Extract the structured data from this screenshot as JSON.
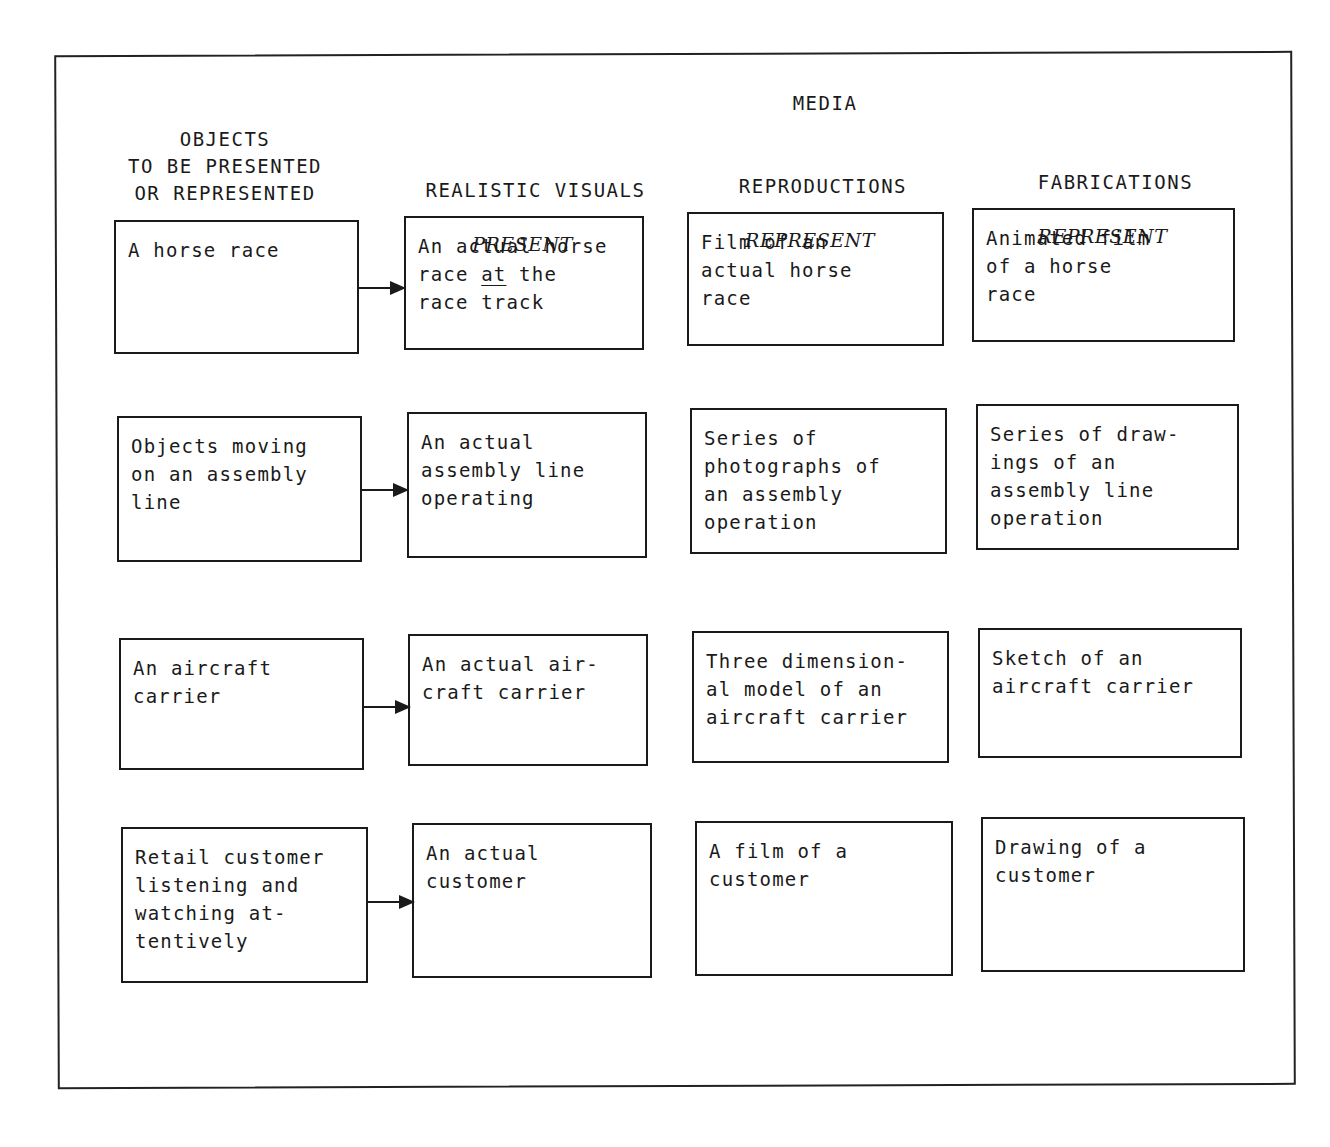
{
  "diagram": {
    "media_label": "MEDIA",
    "columns": [
      {
        "title": "OBJECTS\nTO BE PRESENTED\nOR REPRESENTED",
        "subtitle": ""
      },
      {
        "title": "REALISTIC VISUALS",
        "subtitle": "PRESENT"
      },
      {
        "title": "REPRODUCTIONS",
        "subtitle": "REPRESENT"
      },
      {
        "title": "FABRICATIONS",
        "subtitle": "REPRESENT"
      }
    ],
    "rows": [
      {
        "object": "A horse race",
        "realistic_pre": "An actual horse\nrace ",
        "realistic_underlined": "at",
        "realistic_post": " the\nrace track",
        "reproduction": "Film of an\nactual horse\nrace",
        "fabrication": "Animated film\nof a horse\nrace"
      },
      {
        "object": "Objects moving\non an assembly\nline",
        "realistic": "An actual\nassembly line\noperating",
        "reproduction": "Series of\nphotographs of\nan assembly\noperation",
        "fabrication": "Series of draw-\nings of an\nassembly line\noperation"
      },
      {
        "object": "An aircraft\ncarrier",
        "realistic": "An actual air-\ncraft carrier",
        "reproduction": "Three dimension-\nal model of an\naircraft carrier",
        "fabrication": "Sketch of an\naircraft carrier"
      },
      {
        "object": "Retail customer\nlistening and\nwatching at-\ntentively",
        "realistic": "An actual\ncustomer",
        "reproduction": "A film of a\ncustomer",
        "fabrication": "Drawing of a\ncustomer"
      }
    ]
  }
}
